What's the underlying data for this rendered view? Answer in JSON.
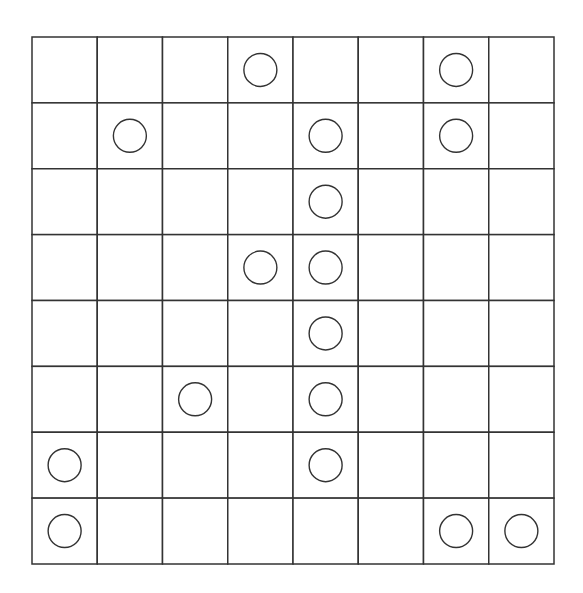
{
  "board": {
    "rows": 8,
    "cols": 8,
    "line_color": "#333333",
    "circle_color": "#333333",
    "background": "#ffffff",
    "pieces": [
      {
        "row": 0,
        "col": 3,
        "type": "circle"
      },
      {
        "row": 0,
        "col": 6,
        "type": "circle"
      },
      {
        "row": 1,
        "col": 1,
        "type": "circle"
      },
      {
        "row": 1,
        "col": 4,
        "type": "circle"
      },
      {
        "row": 1,
        "col": 6,
        "type": "circle"
      },
      {
        "row": 2,
        "col": 4,
        "type": "circle"
      },
      {
        "row": 3,
        "col": 3,
        "type": "circle"
      },
      {
        "row": 3,
        "col": 4,
        "type": "circle"
      },
      {
        "row": 4,
        "col": 4,
        "type": "circle"
      },
      {
        "row": 5,
        "col": 2,
        "type": "circle"
      },
      {
        "row": 5,
        "col": 4,
        "type": "circle"
      },
      {
        "row": 6,
        "col": 0,
        "type": "circle"
      },
      {
        "row": 6,
        "col": 4,
        "type": "circle"
      },
      {
        "row": 7,
        "col": 0,
        "type": "circle"
      },
      {
        "row": 7,
        "col": 6,
        "type": "circle"
      },
      {
        "row": 7,
        "col": 7,
        "type": "circle"
      }
    ]
  }
}
